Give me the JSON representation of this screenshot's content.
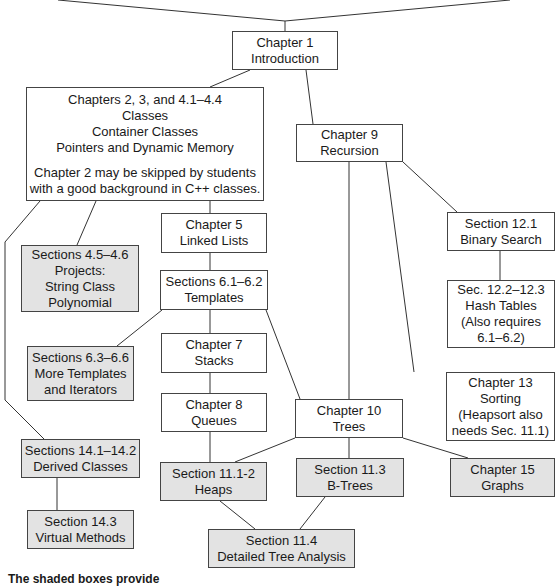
{
  "diagram": {
    "type": "dependency-chart",
    "nodes": {
      "ch1": {
        "lines": [
          "Chapter 1",
          "Introduction"
        ],
        "shaded": false
      },
      "ch2_4": {
        "lines": [
          "Chapters 2, 3, and 4.1–4.4",
          "Classes",
          "Container Classes",
          "Pointers and Dynamic Memory"
        ],
        "note": [
          "Chapter 2 may be skipped by students",
          "with a good background in C++ classes."
        ],
        "shaded": false
      },
      "ch9": {
        "lines": [
          "Chapter 9",
          "Recursion"
        ],
        "shaded": false
      },
      "sec4_5": {
        "lines": [
          "Sections 4.5–4.6",
          "Projects:",
          "String Class",
          "Polynomial"
        ],
        "shaded": true
      },
      "ch5": {
        "lines": [
          "Chapter 5",
          "Linked Lists"
        ],
        "shaded": false
      },
      "sec6_1": {
        "lines": [
          "Sections 6.1–6.2",
          "Templates"
        ],
        "shaded": false
      },
      "sec12_1": {
        "lines": [
          "Section 12.1",
          "Binary Search"
        ],
        "shaded": false
      },
      "sec12_2": {
        "lines": [
          "Sec. 12.2–12.3",
          "Hash Tables",
          "(Also requires",
          "6.1–6.2)"
        ],
        "shaded": false
      },
      "sec6_3": {
        "lines": [
          "Sections 6.3–6.6",
          "More Templates",
          "and Iterators"
        ],
        "shaded": true
      },
      "ch7": {
        "lines": [
          "Chapter 7",
          "Stacks"
        ],
        "shaded": false
      },
      "ch8": {
        "lines": [
          "Chapter 8",
          "Queues"
        ],
        "shaded": false
      },
      "ch13": {
        "lines": [
          "Chapter 13",
          "Sorting",
          "(Heapsort also",
          "needs Sec. 11.1)"
        ],
        "shaded": false
      },
      "ch10": {
        "lines": [
          "Chapter 10",
          "Trees"
        ],
        "shaded": false
      },
      "sec14_1": {
        "lines": [
          "Sections 14.1–14.2",
          "Derived Classes"
        ],
        "shaded": true
      },
      "sec11_1": {
        "lines": [
          "Section 11.1-2",
          "Heaps"
        ],
        "shaded": true
      },
      "sec11_3": {
        "lines": [
          "Section 11.3",
          "B-Trees"
        ],
        "shaded": true
      },
      "ch15": {
        "lines": [
          "Chapter 15",
          "Graphs"
        ],
        "shaded": true
      },
      "sec14_3": {
        "lines": [
          "Section 14.3",
          "Virtual Methods"
        ],
        "shaded": true
      },
      "sec11_4": {
        "lines": [
          "Section 11.4",
          "Detailed Tree Analysis"
        ],
        "shaded": true
      }
    },
    "edges": [
      [
        "ch1",
        "ch2_4"
      ],
      [
        "ch1",
        "ch9"
      ],
      [
        "ch2_4",
        "sec4_5"
      ],
      [
        "ch2_4",
        "ch5"
      ],
      [
        "ch2_4",
        "sec14_1"
      ],
      [
        "ch5",
        "sec6_1"
      ],
      [
        "sec6_1",
        "sec6_3"
      ],
      [
        "sec6_1",
        "ch7"
      ],
      [
        "sec6_1",
        "ch10"
      ],
      [
        "ch7",
        "ch8"
      ],
      [
        "ch8",
        "sec11_1"
      ],
      [
        "ch9",
        "ch10"
      ],
      [
        "ch9",
        "sec12_1"
      ],
      [
        "ch9",
        "ch13"
      ],
      [
        "sec12_1",
        "sec12_2"
      ],
      [
        "ch10",
        "sec11_1"
      ],
      [
        "ch10",
        "sec11_3"
      ],
      [
        "ch10",
        "ch15"
      ],
      [
        "sec11_1",
        "sec11_4"
      ],
      [
        "sec11_3",
        "sec11_4"
      ],
      [
        "sec14_1",
        "sec14_3"
      ]
    ],
    "caption": "The shaded boxes provide",
    "colors": {
      "shaded_fill": "#e3e3e3",
      "box_fill": "#ffffff",
      "line": "#333333"
    }
  }
}
